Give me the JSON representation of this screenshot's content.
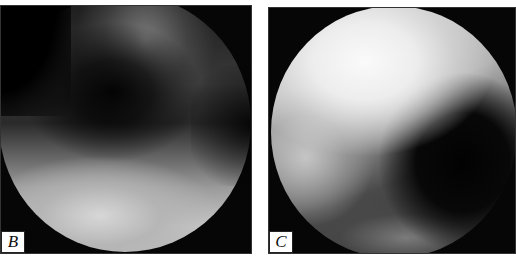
{
  "figure": {
    "panels": [
      {
        "id": "B",
        "label": "B",
        "description": "circular grayscale micrograph with dark diagonal band and bright lower region"
      },
      {
        "id": "C",
        "label": "C",
        "description": "circular grayscale micrograph with bright upper-left region and dark right region"
      }
    ],
    "colors": {
      "background": "#ffffff",
      "panel_fill": "#060606",
      "label_box": "#ffffff",
      "label_text": "#111111"
    }
  }
}
